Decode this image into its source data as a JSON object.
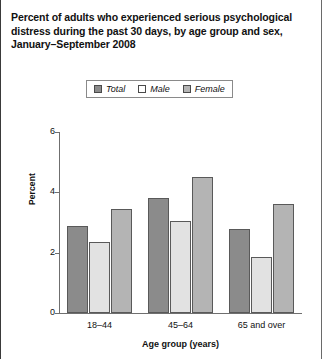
{
  "title": {
    "lines": [
      "Percent of adults who experienced serious psychological",
      "distress during the past 30 days, by age group and sex,",
      "January–September 2008"
    ]
  },
  "legend": {
    "position": "top-center",
    "entries": [
      {
        "label": "Total",
        "color": "#8b8b8b",
        "swatch": "legend-swatch-total"
      },
      {
        "label": "Male",
        "color": "#ffffff",
        "swatch": "legend-swatch-male"
      },
      {
        "label": "Female",
        "color": "#b4b4b4",
        "swatch": "legend-swatch-female"
      }
    ]
  },
  "chart_data": {
    "type": "bar",
    "title": "Percent of adults who experienced serious psychological distress during the past 30 days, by age group and sex, January–September 2008",
    "categories": [
      "18–44",
      "45–64",
      "65 and over"
    ],
    "series": [
      {
        "name": "Total",
        "values": [
          2.9,
          3.8,
          2.8
        ],
        "color": "#8b8b8b"
      },
      {
        "name": "Male",
        "values": [
          2.35,
          3.05,
          1.85
        ],
        "color": "#e2e2e2"
      },
      {
        "name": "Female",
        "values": [
          3.45,
          4.5,
          3.6
        ],
        "color": "#b4b4b4"
      }
    ],
    "xlabel": "Age group (years)",
    "ylabel": "Percent",
    "ylim": [
      0,
      6
    ],
    "yticks": [
      0,
      2,
      4,
      6
    ],
    "ytick_labels": [
      "0",
      "2",
      "4",
      "6"
    ],
    "grid": false,
    "legend_position": "top-center"
  },
  "axes": {
    "y_title": "Percent",
    "x_title": "Age group (years)",
    "y_ticks": [
      "0",
      "2",
      "4",
      "6"
    ],
    "x_ticks": [
      "18–44",
      "45–64",
      "65 and over"
    ]
  }
}
